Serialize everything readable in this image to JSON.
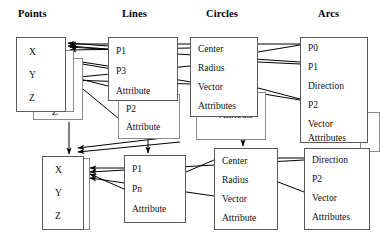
{
  "diagram": {
    "headers": [
      {
        "label": "Points",
        "x": 18,
        "y": 8
      },
      {
        "label": "Lines",
        "x": 122,
        "y": 8
      },
      {
        "label": "Circles",
        "x": 206,
        "y": 8
      },
      {
        "label": "Arcs",
        "x": 318,
        "y": 8
      }
    ],
    "boxes": [
      {
        "id": "points-back-2",
        "name": "points-stack-back-box",
        "layer": "back",
        "x": 33,
        "y": 58,
        "w": 50,
        "h": 62,
        "fields": [
          {
            "label": "Z",
            "x": 18,
            "y": 48
          }
        ]
      },
      {
        "id": "points-back-1",
        "name": "points-stack-mid-box",
        "layer": "back",
        "x": 24,
        "y": 50,
        "w": 50,
        "h": 62,
        "fields": []
      },
      {
        "id": "points-front",
        "name": "points-entity-box",
        "layer": "front",
        "x": 16,
        "y": 37,
        "w": 50,
        "h": 75,
        "fields": [
          {
            "label": "X",
            "x": 12,
            "y": 9
          },
          {
            "label": "Y",
            "x": 12,
            "y": 32
          },
          {
            "label": "Z",
            "x": 12,
            "y": 55
          }
        ]
      },
      {
        "id": "lines-back",
        "name": "lines-stack-back-box",
        "layer": "back",
        "x": 118,
        "y": 94,
        "w": 62,
        "h": 45,
        "fields": [
          {
            "label": "P2",
            "x": 7,
            "y": 9
          },
          {
            "label": "Attribute",
            "x": 7,
            "y": 27
          }
        ]
      },
      {
        "id": "lines-front",
        "name": "lines-entity-box",
        "layer": "front",
        "x": 108,
        "y": 37,
        "w": 70,
        "h": 64,
        "fields": [
          {
            "label": "P1",
            "x": 7,
            "y": 8
          },
          {
            "label": "P3",
            "x": 7,
            "y": 28
          },
          {
            "label": "Attribute",
            "x": 7,
            "y": 48
          }
        ]
      },
      {
        "id": "circles-back",
        "name": "circles-stack-back-box",
        "layer": "back",
        "x": 196,
        "y": 92,
        "w": 70,
        "h": 48,
        "fields": [
          {
            "label": "Attribute",
            "x": 22,
            "y": 17
          }
        ]
      },
      {
        "id": "circles-front",
        "name": "circles-entity-box",
        "layer": "front",
        "x": 190,
        "y": 37,
        "w": 68,
        "h": 80,
        "fields": [
          {
            "label": "Center",
            "x": 7,
            "y": 6
          },
          {
            "label": "Radius",
            "x": 7,
            "y": 25
          },
          {
            "label": "Vector",
            "x": 7,
            "y": 44
          },
          {
            "label": "Attributes",
            "x": 7,
            "y": 63
          }
        ]
      },
      {
        "id": "arcs-back",
        "name": "arcs-stack-back-box",
        "layer": "back",
        "x": 360,
        "y": 112,
        "w": 20,
        "h": 40,
        "fields": []
      },
      {
        "id": "arcs-front",
        "name": "arcs-entity-box",
        "layer": "front",
        "x": 300,
        "y": 37,
        "w": 68,
        "h": 106,
        "fields": [
          {
            "label": "P0",
            "x": 7,
            "y": 5
          },
          {
            "label": "P1",
            "x": 7,
            "y": 24
          },
          {
            "label": "Direction",
            "x": 7,
            "y": 43
          },
          {
            "label": "P2",
            "x": 7,
            "y": 62
          },
          {
            "label": "Vector",
            "x": 7,
            "y": 81
          },
          {
            "label": "Attributes",
            "x": 7,
            "y": 95
          }
        ]
      },
      {
        "id": "points2-back",
        "name": "polyline-points-stack-back-box",
        "layer": "back",
        "x": 46,
        "y": 158,
        "w": 44,
        "h": 72,
        "fields": []
      },
      {
        "id": "points2-front",
        "name": "polyline-points-entity-box",
        "layer": "front",
        "x": 42,
        "y": 156,
        "w": 42,
        "h": 74,
        "fields": [
          {
            "label": "X",
            "x": 12,
            "y": 8
          },
          {
            "label": "Y",
            "x": 12,
            "y": 31
          },
          {
            "label": "Z",
            "x": 12,
            "y": 54
          }
        ]
      },
      {
        "id": "polyline-front",
        "name": "polyline-entity-box",
        "layer": "front",
        "x": 124,
        "y": 155,
        "w": 62,
        "h": 68,
        "fields": [
          {
            "label": "P1",
            "x": 7,
            "y": 8
          },
          {
            "label": "Pn",
            "x": 7,
            "y": 28
          },
          {
            "label": "Attribute",
            "x": 7,
            "y": 48
          }
        ]
      },
      {
        "id": "circles2-front",
        "name": "arc-circles-entity-box",
        "layer": "front",
        "x": 214,
        "y": 148,
        "w": 64,
        "h": 82,
        "fields": [
          {
            "label": "Center",
            "x": 7,
            "y": 7
          },
          {
            "label": "Radius",
            "x": 7,
            "y": 26
          },
          {
            "label": "Vector",
            "x": 7,
            "y": 45
          },
          {
            "label": "Attribute",
            "x": 7,
            "y": 64
          }
        ]
      },
      {
        "id": "arcs2-front",
        "name": "arc-detail-entity-box",
        "layer": "front",
        "x": 304,
        "y": 148,
        "w": 66,
        "h": 82,
        "fields": [
          {
            "label": "Direction",
            "x": 7,
            "y": 6
          },
          {
            "label": "P2",
            "x": 7,
            "y": 25
          },
          {
            "label": "Vector",
            "x": 7,
            "y": 44
          },
          {
            "label": "Attributes",
            "x": 7,
            "y": 63
          }
        ]
      }
    ],
    "edges": [
      {
        "name": "edge-lines-p1-to-points-x",
        "from": [
          108,
          46
        ],
        "to": [
          68,
          43
        ],
        "arrow": true
      },
      {
        "name": "edge-lines-p1b-to-points-x",
        "from": [
          108,
          49
        ],
        "to": [
          68,
          46
        ],
        "arrow": true
      },
      {
        "name": "edge-lines-p3-to-points-y",
        "from": [
          108,
          66
        ],
        "to": [
          68,
          60
        ],
        "arrow": true
      },
      {
        "name": "edge-lines-attr-to-points-z",
        "from": [
          108,
          86
        ],
        "to": [
          68,
          76
        ],
        "arrow": true
      },
      {
        "name": "edge-arcs-p0-to-points-x",
        "from": [
          300,
          44
        ],
        "to": [
          70,
          44
        ],
        "arrow": true
      },
      {
        "name": "edge-arcs-p1-to-points-x",
        "from": [
          300,
          62
        ],
        "to": [
          70,
          47
        ],
        "arrow": true
      },
      {
        "name": "edge-arcs-p2-to-points-y",
        "from": [
          300,
          100
        ],
        "to": [
          70,
          62
        ],
        "arrow": true
      },
      {
        "name": "edge-circles-center-to-points",
        "from": [
          190,
          48
        ],
        "to": [
          70,
          50
        ],
        "arrow": true
      },
      {
        "name": "edge-circles-radius-to-points",
        "from": [
          190,
          66
        ],
        "to": [
          70,
          78
        ],
        "arrow": true
      },
      {
        "name": "edge-circles-vector-to-points-z",
        "from": [
          190,
          84
        ],
        "to": [
          70,
          80
        ],
        "arrow": true
      },
      {
        "name": "edge-lines-p2-to-points-down",
        "from": [
          118,
          118
        ],
        "to": [
          72,
          80
        ],
        "arrow": true
      },
      {
        "name": "edge-polyline-to-points2-x",
        "from": [
          124,
          168
        ],
        "to": [
          90,
          168
        ],
        "arrow": true
      },
      {
        "name": "edge-polyline-pn-to-points2-x",
        "from": [
          124,
          189
        ],
        "to": [
          90,
          174
        ],
        "arrow": true
      },
      {
        "name": "edge-arcs2-to-points2",
        "from": [
          304,
          160
        ],
        "to": [
          90,
          172
        ],
        "arrow": true
      },
      {
        "name": "edge-circles2-to-points2",
        "from": [
          214,
          196
        ],
        "to": [
          90,
          178
        ],
        "arrow": true
      },
      {
        "name": "edge-stack-points-down",
        "from": [
          69,
          122
        ],
        "to": [
          69,
          154
        ],
        "arrow": true
      },
      {
        "name": "edge-lines-attr-down",
        "from": [
          148,
          140
        ],
        "to": [
          148,
          153
        ],
        "arrow": true
      },
      {
        "name": "edge-circles-attr-down",
        "from": [
          243,
          128
        ],
        "to": [
          243,
          146
        ],
        "arrow": true
      },
      {
        "name": "edge-lines-stack-to-points2",
        "from": [
          180,
          136
        ],
        "to": [
          78,
          148
        ],
        "arrow": true
      },
      {
        "name": "edge-lines-stack-to-points2b",
        "from": [
          180,
          142
        ],
        "to": [
          78,
          152
        ],
        "arrow": true
      },
      {
        "name": "edge-circles-to-arcs-p0",
        "from": [
          258,
          52
        ],
        "to": [
          300,
          45
        ],
        "arrow": false
      },
      {
        "name": "edge-circles-to-arcs-p1",
        "from": [
          258,
          62
        ],
        "to": [
          300,
          64
        ],
        "arrow": false
      },
      {
        "name": "edge-circles-to-arcs-p2",
        "from": [
          258,
          88
        ],
        "to": [
          300,
          99
        ],
        "arrow": false
      },
      {
        "name": "edge-circles2-to-arcs2-top",
        "from": [
          278,
          158
        ],
        "to": [
          304,
          158
        ],
        "arrow": false
      },
      {
        "name": "edge-circles2-to-arcs2-mid",
        "from": [
          278,
          182
        ],
        "to": [
          304,
          192
        ],
        "arrow": false
      },
      {
        "name": "edge-polyline-to-circles2",
        "from": [
          186,
          172
        ],
        "to": [
          214,
          160
        ],
        "arrow": false
      },
      {
        "name": "edge-arcs-back-right",
        "from": [
          368,
          124
        ],
        "to": [
          380,
          124
        ],
        "arrow": false
      }
    ]
  }
}
